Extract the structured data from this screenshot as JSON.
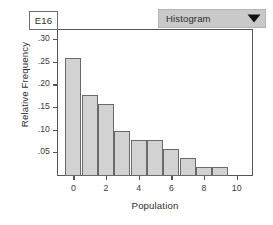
{
  "cell": {
    "reference_label": "E16"
  },
  "dropdown": {
    "selected": "Histogram",
    "arrow_icon": "triangle-down-icon",
    "options": [
      "Histogram"
    ],
    "background_color": "#c9c9c9"
  },
  "chart_data": {
    "type": "bar",
    "title": "",
    "subtitle": "",
    "xlabel": "Population",
    "ylabel": "Relative Frequency",
    "categories": [
      0,
      1,
      2,
      3,
      4,
      5,
      6,
      7,
      8,
      9
    ],
    "values": [
      0.26,
      0.18,
      0.16,
      0.1,
      0.08,
      0.08,
      0.06,
      0.04,
      0.02,
      0.02
    ],
    "x_tick_labels": [
      "0",
      "2",
      "4",
      "6",
      "8",
      "10"
    ],
    "x_tick_values": [
      0,
      2,
      4,
      6,
      8,
      10
    ],
    "y_tick_labels": [
      ".05",
      ".10",
      ".15",
      ".20",
      ".25",
      ".30"
    ],
    "y_tick_values": [
      0.05,
      0.1,
      0.15,
      0.2,
      0.25,
      0.3
    ],
    "xlim": [
      -1,
      11
    ],
    "ylim": [
      0,
      0.325
    ],
    "grid": false,
    "legend": false,
    "bar_fill_color": "#d2d2d2",
    "bar_edge_color": "#6a6a6a",
    "axis_color": "#555555"
  }
}
